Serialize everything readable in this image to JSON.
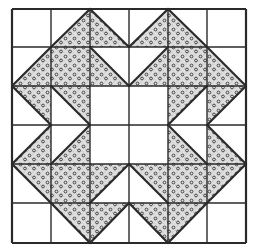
{
  "diagram": {
    "type": "quilt-block",
    "grid": {
      "cols": 6,
      "rows": 6,
      "x_lines": [
        12,
        51,
        90,
        129,
        168,
        207,
        246
      ],
      "y_lines": [
        9,
        47,
        86,
        125,
        164,
        203,
        243
      ]
    },
    "colors": {
      "background": "#ffffff",
      "line": "#2a2a2a",
      "fill_stipple": "#d8d8d8",
      "fill_dot": "#333333"
    },
    "cells": [
      [
        "white",
        "lower-right",
        "lower-left",
        "lower-right",
        "lower-left",
        "white"
      ],
      [
        "lower-right",
        "full",
        "lower-left",
        "lower-right",
        "full",
        "lower-left"
      ],
      [
        "upper-right",
        "upper-right",
        "white",
        "white",
        "upper-left",
        "upper-left"
      ],
      [
        "lower-right",
        "lower-right",
        "white",
        "white",
        "lower-left",
        "lower-left"
      ],
      [
        "upper-right",
        "full",
        "upper-left",
        "upper-right",
        "full",
        "upper-left"
      ],
      [
        "white",
        "upper-right",
        "upper-left",
        "upper-right",
        "upper-left",
        "white"
      ]
    ]
  }
}
